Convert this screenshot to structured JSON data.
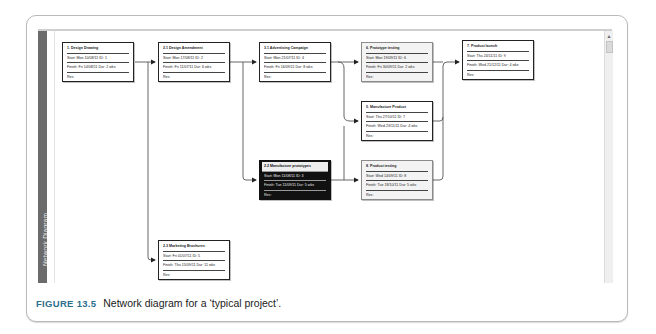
{
  "sidebar": {
    "label": "Network Diagram"
  },
  "scrollbar": {
    "up_arrow": "▲"
  },
  "nodes": [
    {
      "title": "1. Design Drawing",
      "start": "Start: Mon 10/08/11  ID: 1",
      "finish": "Finish: Fri 14/08/11  Dur: 2 wks",
      "res": "Res:"
    },
    {
      "title": "2.1 Design Amendment",
      "start": "Start: Mon 17/08/11  ID: 2",
      "finish": "Finish: Fri 11/07/11  Dur: 6 wks",
      "res": "Res:"
    },
    {
      "title": "3.1 Advertising Campaign",
      "start": "Start: Mon 21/07/11  ID: 4",
      "finish": "Finish: Fri 16/09/11  Dur: 8 wks",
      "res": "Res:"
    },
    {
      "title": "6. Prototype testing",
      "start": "Start: Mon 19/09/11  ID: 6",
      "finish": "Finish: Fri 30/09/11  Dur: 2 wks",
      "res": "Res:"
    },
    {
      "title": "7. Product launch",
      "start": "Start: Thu 24/11/11  ID: 9",
      "finish": "Finish: Wed 21/12/11  Dur: 4 wks",
      "res": "Res:"
    },
    {
      "title": "5. Manufacture Product",
      "start": "Start: Thu 27/10/11  ID: 7",
      "finish": "Finish: Wed 23/11/11  Dur: 4 wks",
      "res": "Res:"
    },
    {
      "title": "2.2 Manufacture prototypes",
      "start": "Start: Mon 11/08/11  ID: 3",
      "finish": "Finish: Tue 11/09/11  Dur: 5 wks",
      "res": "Res:"
    },
    {
      "title": "8. Product testing",
      "start": "Start: Wed 14/09/11  ID: 8",
      "finish": "Finish: Tue 18/10/11  Dur: 5 wks",
      "res": "Res:"
    },
    {
      "title": "2.3 Marketing Brochures",
      "start": "Start: Fri 01/07/11  ID: 5",
      "finish": "Finish: Thu 15/09/11  Dur: 11 wks",
      "res": "Res:"
    }
  ],
  "caption": {
    "figure": "FIGURE 13.5",
    "text": "Network diagram for a ‘typical project’."
  },
  "colors": {
    "sidebar": "#6b6b6b",
    "critical_fill": "#111111",
    "light_fill": "#f3f3f3",
    "figure_label": "#2d6f8f"
  }
}
